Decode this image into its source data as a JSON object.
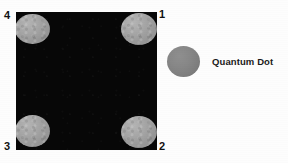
{
  "figure": {
    "kind": "quantum-dot-array-micrograph",
    "width": 288,
    "height": 163,
    "background_color": "#fdfdfd"
  },
  "substrate": {
    "label": "black substrate region",
    "color": "#070707",
    "x": 16,
    "y": 12,
    "width": 141,
    "height": 138
  },
  "dots": [
    {
      "id": "dot-1",
      "position": "top-left",
      "corner_index": "4",
      "color": "#a0a0a0"
    },
    {
      "id": "dot-2",
      "position": "top-right",
      "corner_index": "1",
      "color": "#a0a0a0"
    },
    {
      "id": "dot-3",
      "position": "bottom-left",
      "corner_index": "3",
      "color": "#a0a0a0"
    },
    {
      "id": "dot-4",
      "position": "bottom-right",
      "corner_index": "2",
      "color": "#a0a0a0"
    }
  ],
  "corner_labels": {
    "top_left": "4",
    "top_right": "1",
    "bottom_left": "3",
    "bottom_right": "2"
  },
  "legend": {
    "label": "Quantum Dot",
    "swatch_color": "#808080",
    "swatch_shape": "ellipse"
  },
  "caption_remnant": {
    "text": ""
  }
}
